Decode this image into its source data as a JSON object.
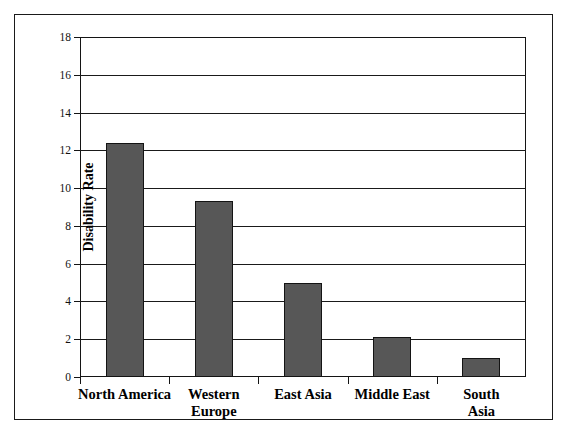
{
  "chart_data": {
    "type": "bar",
    "title": "",
    "xlabel": "",
    "ylabel": "Disability Rate",
    "categories": [
      "North America",
      "Western\nEurope",
      "East Asia",
      "Middle East",
      "South Asia"
    ],
    "values": [
      12.4,
      9.3,
      5.0,
      2.1,
      1.0
    ],
    "ylim": [
      0,
      18
    ],
    "ytick_labels": [
      "0",
      "2",
      "4",
      "6",
      "8",
      "10",
      "12",
      "14",
      "16",
      "18"
    ],
    "ytick_values": [
      0,
      2,
      4,
      6,
      8,
      10,
      12,
      14,
      16,
      18
    ],
    "grid": true,
    "legend": false,
    "bar_color": "#575757",
    "bar_edge_color": "#141414",
    "axis_color": "#141414",
    "background_color": "#ffffff"
  },
  "figure": {
    "frame_border_color": "#1a1a1a"
  }
}
